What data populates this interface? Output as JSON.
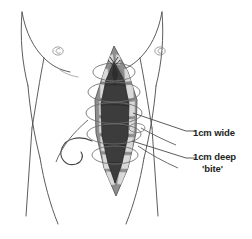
{
  "figure": {
    "kind": "medical-illustration",
    "view": "anterior torso"
  },
  "annotations": [
    {
      "id": "wide",
      "text": "1cm wide",
      "points_to": "suture bite width along wound edge"
    },
    {
      "id": "deep",
      "line1": "1cm deep",
      "line2": "'bite'",
      "points_to": "suture bite depth into fascia"
    }
  ],
  "anatomy": {
    "torso": "abdominal wall outline",
    "umbilicus": "navel",
    "nipple_left": "left nipple",
    "nipple_right": "right nipple",
    "wound": "vertical midline laparotomy incision",
    "wound_cavity": "open wound depth",
    "sutures": "continuous suture loops"
  },
  "colors": {
    "outline": "#3f3f3f",
    "tissue": "#8e8e8e",
    "tissue_dark": "#6f6f6f",
    "cavity": "#3c3c3c",
    "cavity_deep": "#2e2e2e",
    "suture": "#d8d8d8",
    "suture_edge": "#9a9a9a",
    "text": "#231f20",
    "background": "#ffffff"
  }
}
